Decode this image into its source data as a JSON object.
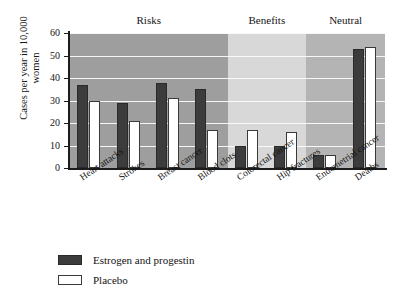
{
  "chart_data": {
    "type": "bar",
    "title": "",
    "xlabel": "",
    "ylabel": "Cases per year in 10,000 women",
    "ylim": [
      0,
      60
    ],
    "ytick_labels": [
      "0",
      "10",
      "20",
      "30",
      "40",
      "50",
      "60"
    ],
    "ytick_values": [
      0,
      10,
      20,
      30,
      40,
      50,
      60
    ],
    "grid": true,
    "legend_position": "below-left",
    "categories": [
      "Heart attacks",
      "Strokes",
      "Breast cancer",
      "Blood clots",
      "Colorectal cancer",
      "Hip fractures",
      "Endometrial cancer",
      "Deaths"
    ],
    "series": [
      {
        "name": "Estrogen and progestin",
        "color": "#3c3c3c",
        "values": [
          37,
          29,
          38,
          35,
          10,
          10,
          6,
          53
        ]
      },
      {
        "name": "Placebo",
        "color": "#ffffff",
        "values": [
          30,
          21,
          31,
          17,
          17,
          16,
          6,
          54
        ]
      }
    ],
    "bands": [
      {
        "label": "Risks",
        "categories": [
          "Heart attacks",
          "Strokes",
          "Breast cancer",
          "Blood clots"
        ],
        "color": "#9e9e9e"
      },
      {
        "label": "Benefits",
        "categories": [
          "Colorectal cancer",
          "Hip fractures"
        ],
        "color": "#d8d8d8"
      },
      {
        "label": "Neutral",
        "categories": [
          "Endometrial cancer",
          "Deaths"
        ],
        "color": "#b4b4b4"
      }
    ]
  },
  "legend": {
    "items": [
      {
        "label": "Estrogen and progestin",
        "swatch": "dark"
      },
      {
        "label": "Placebo",
        "swatch": "light"
      }
    ]
  }
}
